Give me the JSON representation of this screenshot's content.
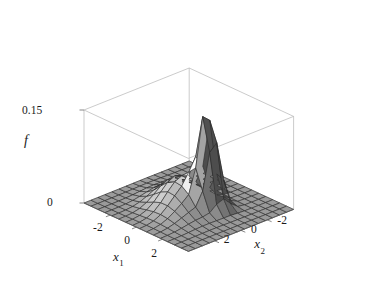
{
  "figure": {
    "kind": "surface-plot-3d",
    "background_color": "#ffffff",
    "line_color": "#2b2b2b",
    "box_color": "#b4b4b4",
    "width": 376,
    "height": 301
  },
  "axes": {
    "z": {
      "label": "f",
      "ticks": [
        "0.15",
        "0"
      ],
      "tick_values": [
        0.15,
        0
      ],
      "range": [
        0,
        0.15
      ]
    },
    "x1": {
      "label": "x",
      "subscript": "1",
      "ticks": [
        "-2",
        "0",
        "2"
      ],
      "tick_values": [
        -2,
        0,
        2
      ],
      "range": [
        -4,
        4
      ]
    },
    "x2": {
      "label": "x",
      "subscript": "2",
      "ticks": [
        "2",
        "0",
        "-2"
      ],
      "tick_values": [
        2,
        0,
        -2
      ],
      "range": [
        -4,
        4
      ]
    }
  },
  "chart_data": {
    "type": "surface",
    "title": "",
    "xlabel": "x1",
    "ylabel": "x2",
    "zlabel": "f",
    "xlim": [
      -4,
      4
    ],
    "ylim": [
      -4,
      4
    ],
    "zlim": [
      0,
      0.15
    ],
    "grid": true,
    "legend": "none",
    "colormap": "grayscale",
    "mesh_n": 15,
    "components": [
      {
        "name": "broad-peak",
        "weight": 0.62,
        "mu": [
          -0.35,
          0.35
        ],
        "sigma": [
          1.15,
          1.15
        ],
        "rho": 0.25
      },
      {
        "name": "narrow-peak",
        "weight": 0.38,
        "mu": [
          0.95,
          -0.55
        ],
        "sigma": [
          0.46,
          0.52
        ],
        "rho": -0.15
      }
    ],
    "z_peak": 0.15,
    "z_floor": 0.0
  },
  "view": {
    "azimuth_deg": 35,
    "elevation_deg": 27,
    "projection": "orthographic"
  }
}
